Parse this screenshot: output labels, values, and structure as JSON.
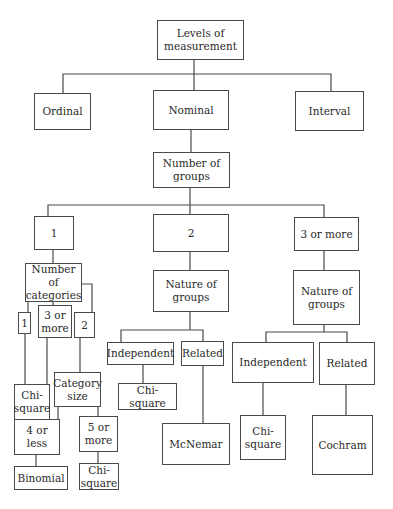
{
  "diagram": {
    "type": "decision-tree",
    "nodes": {
      "root": "Levels of\nmeasurement",
      "ordinal": "Ordinal",
      "nominal": "Nominal",
      "interval": "Interval",
      "number_of_groups": "Number of\ngroups",
      "groups_1": "1",
      "groups_2": "2",
      "groups_3_or_more": "3 or more",
      "number_of_categories": "Number of\ncategories",
      "categories_1": "1",
      "categories_3_or_more": "3 or\nmore",
      "categories_2": "2",
      "chi_square_cat1": "Chi-\nsquare",
      "category_size": "Category\nsize",
      "size_4_or_less": "4 or\nless",
      "size_5_or_more": "5 or\nmore",
      "binomial": "Binomial",
      "chi_square_size5": "Chi-\nsquare",
      "nature_of_groups_2": "Nature of\ngroups",
      "independent_2": "Independent",
      "related_2": "Related",
      "chi_square_2": "Chi-\nsquare",
      "mcnemar": "McNemar",
      "nature_of_groups_3": "Nature of\ngroups",
      "independent_3": "Independent",
      "related_3": "Related",
      "chi_square_3": "Chi-\nsquare",
      "cochram": "Cochram"
    },
    "edges": [
      [
        "root",
        "ordinal"
      ],
      [
        "root",
        "nominal"
      ],
      [
        "root",
        "interval"
      ],
      [
        "nominal",
        "number_of_groups"
      ],
      [
        "number_of_groups",
        "groups_1"
      ],
      [
        "number_of_groups",
        "groups_2"
      ],
      [
        "number_of_groups",
        "groups_3_or_more"
      ],
      [
        "groups_1",
        "number_of_categories"
      ],
      [
        "number_of_categories",
        "categories_1"
      ],
      [
        "number_of_categories",
        "categories_3_or_more"
      ],
      [
        "number_of_categories",
        "categories_2"
      ],
      [
        "categories_1",
        "chi_square_cat1"
      ],
      [
        "categories_3_or_more",
        "chi_square_cat1"
      ],
      [
        "categories_2",
        "category_size"
      ],
      [
        "category_size",
        "size_4_or_less"
      ],
      [
        "category_size",
        "size_5_or_more"
      ],
      [
        "size_4_or_less",
        "binomial"
      ],
      [
        "size_5_or_more",
        "chi_square_size5"
      ],
      [
        "groups_2",
        "nature_of_groups_2"
      ],
      [
        "nature_of_groups_2",
        "independent_2"
      ],
      [
        "nature_of_groups_2",
        "related_2"
      ],
      [
        "independent_2",
        "chi_square_2"
      ],
      [
        "related_2",
        "mcnemar"
      ],
      [
        "groups_3_or_more",
        "nature_of_groups_3"
      ],
      [
        "nature_of_groups_3",
        "independent_3"
      ],
      [
        "nature_of_groups_3",
        "related_3"
      ],
      [
        "independent_3",
        "chi_square_3"
      ],
      [
        "related_3",
        "cochram"
      ]
    ],
    "colors": {
      "line": "#4a4a4a",
      "text": "#2a2a2a",
      "background": "#ffffff"
    }
  }
}
